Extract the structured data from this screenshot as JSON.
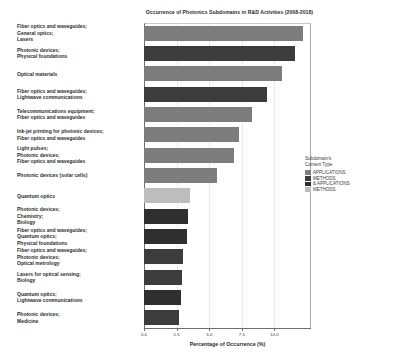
{
  "chart_data": {
    "type": "bar",
    "orientation": "horizontal",
    "title": "Occurrence of Photonics Subdomains in R&D Activities (2008-2018)",
    "xlabel": "Percentage of Occurrence (%)",
    "ylabel": "",
    "xlim": [
      0.0,
      12.8
    ],
    "xticks": [
      "0.0",
      "2.5",
      "5.0",
      "7.5",
      "10.0"
    ],
    "xtick_values": [
      0.0,
      2.5,
      5.0,
      7.5,
      10.0
    ],
    "grid": false,
    "legend_position": "right",
    "categories": [
      "Fiber optics and waveguides;\nGeneral optics;\nLasers",
      "Photonic devices;\nPhysical foundations",
      "Optical materials",
      "Fiber optics and waveguides;\nLightwave communications",
      "Telecommunications equipment;\nFiber optics and waveguides",
      "Ink-jet printing for photonic devices;\nFiber optics and waveguides",
      "Light pulses;\nPhotonic devices;\nFiber optics and waveguides",
      "Photonic devices (solar cells)",
      "Quantum optics",
      "Photonic devices;\nChemistry;\nBiology",
      "Fiber optics and waveguides;\nQuantum optics;\nPhysical foundations",
      "Fiber optics and waveguides;\nPhotonic devices;\nOptical metrology",
      "Lasers for optical sensing;\nBiology",
      "Quantum optics;\nLightwave communications",
      "Photonic devices;\nMedicine"
    ],
    "values": [
      12.2,
      11.6,
      10.6,
      9.4,
      8.3,
      7.3,
      6.9,
      5.6,
      3.5,
      3.4,
      3.3,
      3.0,
      2.9,
      2.8,
      2.7
    ],
    "bar_colors": [
      "#7d7d7d",
      "#3c3c3c",
      "#7d7d7d",
      "#3c3c3c",
      "#7d7d7d",
      "#7d7d7d",
      "#7d7d7d",
      "#7d7d7d",
      "#bdbdbd",
      "#2f2f2f",
      "#2f2f2f",
      "#3c3c3c",
      "#3c3c3c",
      "#2f2f2f",
      "#3c3c3c"
    ]
  },
  "legend": {
    "title": "Subdomain's\nContent Type",
    "entries": [
      {
        "label": "APPLICATIONS",
        "color": "#7d7d7d"
      },
      {
        "label": "METHODS",
        "color": "#3c3c3c"
      },
      {
        "label": "& APPLICATIONS",
        "color": "#2f2f2f"
      },
      {
        "label": "METHODS",
        "color": "#bdbdbd"
      }
    ]
  }
}
